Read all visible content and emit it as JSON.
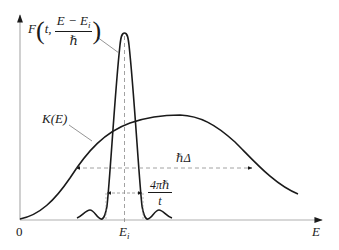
{
  "figure": {
    "type": "schematic-plot",
    "axes": {
      "x_label": "E",
      "origin_label": "0",
      "x_marker_label": "E",
      "x_marker_sub": "i",
      "axis_color": "#b0b0b0"
    },
    "curves": {
      "F": {
        "label_prefix": "F",
        "label_arg_t": "t,",
        "label_num": "E − E",
        "label_num_sub": "i",
        "label_den": "ℏ",
        "description": "sharp peak centered at E_i with small side ripples"
      },
      "K": {
        "label": "K(E)",
        "description": "broad bell-shaped distribution"
      }
    },
    "annotations": {
      "wide_width": "ℏΔ",
      "narrow_width_num": "4πℏ",
      "narrow_width_den": "t"
    },
    "colors": {
      "curve": "#1a1a1a",
      "dashed": "#8a8a8a",
      "leader": "#7a7a7a"
    }
  }
}
